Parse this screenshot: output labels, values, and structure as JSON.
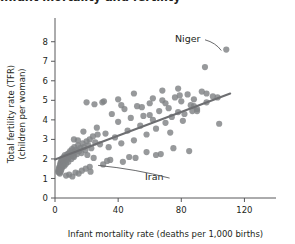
{
  "figure": {
    "cut_off_title": "Infant mortality and fertility"
  },
  "chart_data": {
    "type": "scatter",
    "title": "",
    "xlabel": "Infant mortality rate (deaths per 1,000 births)",
    "ylabel": "Total fertility rate (TFR)\n(children per woman)",
    "ylabel_line1": "Total fertility rate (TFR)",
    "ylabel_line2": "(children per woman)",
    "xlim": [
      0,
      140
    ],
    "ylim": [
      0,
      8.6
    ],
    "xticks": [
      0,
      40,
      80,
      120
    ],
    "xtick_labels": [
      "0",
      "40",
      "80",
      "120"
    ],
    "yticks": [
      0,
      1,
      2,
      3,
      4,
      5,
      6,
      7,
      8
    ],
    "ytick_labels": [
      "0",
      "1",
      "2",
      "3",
      "4",
      "5",
      "6",
      "7",
      "8"
    ],
    "grid": false,
    "legend": "none",
    "point_color": "#808285",
    "trendline_color": "#6d6e71",
    "trendline": {
      "x0": 0,
      "y0": 1.97,
      "x1": 111,
      "y1": 5.35
    },
    "annotations": [
      {
        "label": "Niger",
        "x": 108.5,
        "y": 7.6,
        "label_x": 76,
        "label_y": 8.15
      },
      {
        "label": "Iran",
        "x": 30.5,
        "y": 1.72,
        "label_x": 57,
        "label_y": 1.07
      }
    ],
    "x": [
      2.0,
      2.3,
      2.5,
      2.6,
      2.8,
      3.0,
      3.1,
      3.2,
      3.3,
      3.5,
      3.6,
      3.8,
      3.9,
      4.0,
      4.1,
      4.3,
      4.4,
      4.6,
      4.8,
      5.0,
      5.2,
      5.4,
      5.6,
      5.8,
      6.0,
      6.3,
      6.5,
      6.8,
      7.0,
      7.3,
      7.6,
      7.9,
      8.2,
      8.5,
      8.8,
      9.2,
      9.6,
      10.0,
      10.4,
      10.8,
      11.2,
      11.7,
      12.2,
      12.8,
      13.4,
      14.0,
      14.6,
      15.3,
      16.0,
      16.8,
      17.5,
      18.3,
      19.2,
      20.0,
      21.0,
      22.0,
      23.0,
      24.0,
      25.5,
      27.0,
      7.0,
      9.0,
      11.0,
      13.0,
      15.0,
      17.0,
      19.5,
      22.5,
      12.0,
      14.5,
      18.0,
      20.5,
      24.5,
      26.5,
      28.5,
      30.5,
      32.0,
      34.0,
      36.0,
      38.0,
      40.0,
      42.0,
      44.0,
      46.0,
      48.0,
      50.0,
      52.0,
      54.0,
      56.0,
      58.0,
      60.0,
      62.0,
      64.0,
      66.0,
      68.0,
      70.0,
      72.0,
      74.0,
      76.0,
      78.0,
      80.0,
      82.0,
      84.0,
      86.0,
      88.0,
      90.0,
      93.0,
      96.0,
      100.0,
      104.0,
      108.5,
      20.0,
      31.0,
      42.0,
      55.0,
      62.0,
      70.0,
      79.0,
      88.0,
      96.0,
      103.0,
      35.0,
      47.0,
      58.0,
      67.0,
      75.0,
      85.0,
      12.0,
      25.0,
      43.0,
      51.0,
      64.0,
      73.0,
      81.0,
      90.0,
      30.0,
      40.0,
      50.0,
      60.0,
      68.0,
      78.0,
      87.0,
      95.0,
      22.0,
      33.0
    ],
    "y": [
      1.35,
      1.45,
      1.3,
      1.55,
      1.4,
      1.6,
      1.25,
      1.7,
      1.5,
      1.8,
      1.35,
      1.65,
      1.9,
      1.45,
      1.75,
      1.55,
      2.0,
      1.85,
      1.6,
      1.95,
      1.7,
      2.1,
      1.8,
      2.0,
      1.65,
      2.2,
      1.9,
      2.05,
      1.75,
      2.15,
      1.95,
      2.25,
      2.05,
      1.85,
      2.3,
      2.1,
      2.4,
      2.2,
      2.0,
      2.5,
      2.3,
      2.15,
      2.6,
      2.35,
      2.45,
      2.25,
      2.7,
      2.4,
      2.55,
      2.3,
      2.8,
      2.6,
      2.45,
      2.9,
      2.7,
      3.0,
      2.55,
      3.15,
      2.85,
      3.25,
      1.15,
      1.2,
      1.1,
      1.3,
      1.25,
      1.4,
      1.5,
      1.35,
      3.0,
      2.95,
      3.4,
      2.2,
      2.05,
      3.6,
      2.75,
      1.72,
      3.3,
      2.6,
      4.3,
      3.1,
      3.9,
      2.8,
      4.55,
      3.45,
      4.1,
      2.95,
      4.7,
      3.7,
      4.2,
      3.25,
      4.85,
      4.0,
      3.55,
      4.45,
      5.0,
      3.85,
      4.6,
      4.15,
      5.15,
      4.4,
      4.95,
      4.3,
      5.3,
      4.75,
      5.05,
      4.55,
      5.45,
      4.9,
      5.2,
      3.8,
      7.6,
      4.9,
      4.95,
      4.75,
      4.65,
      5.1,
      4.85,
      5.25,
      4.7,
      5.35,
      5.15,
      1.95,
      2.1,
      2.35,
      2.25,
      2.55,
      2.4,
      2.1,
      4.8,
      1.85,
      2.05,
      2.2,
      3.35,
      3.95,
      4.45,
      4.9,
      5.05,
      5.35,
      4.25,
      5.5,
      5.6,
      4.45,
      6.7,
      1.6,
      1.9
    ]
  }
}
